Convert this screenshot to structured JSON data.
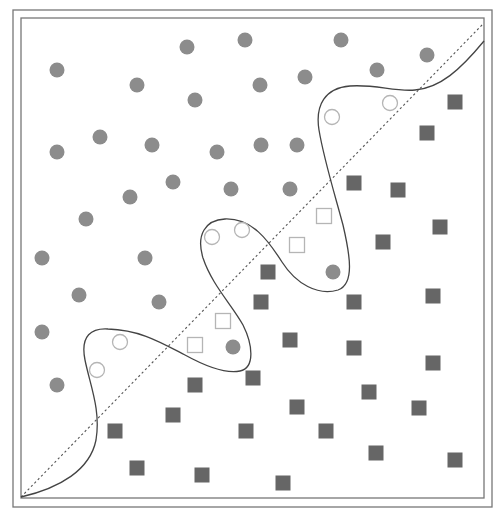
{
  "colors": {
    "background": "#ffffff",
    "frame": "#777777",
    "boundary_curve": "#444444",
    "linear_boundary": "#555555",
    "class_a_fill": "#8c8c8c",
    "class_b_fill": "#666666",
    "hollow_stroke": "#b5b5b5"
  },
  "frame": {
    "outer": {
      "x": 13,
      "y": 10,
      "w": 479,
      "h": 497
    },
    "inner": {
      "x": 21,
      "y": 18,
      "w": 463,
      "h": 480
    }
  },
  "linear_boundary": {
    "style": "dotted",
    "from": [
      21,
      497
    ],
    "to": [
      483,
      24
    ]
  },
  "nonlinear_boundary": {
    "style": "solid",
    "path": "M21,497 C60,488 90,470 96,440 C101,410 90,385 85,360 C80,335 92,328 108,329 C140,330 160,342 185,355 C205,366 225,374 240,371 C255,368 253,345 243,325 C232,305 212,285 203,258 C196,235 205,220 225,219 C252,218 268,240 282,262 C296,284 318,296 338,290 C355,284 350,255 343,225 C335,195 324,160 319,130 C315,105 325,88 350,86 C375,84 395,92 415,90 C440,88 460,70 484,41"
  },
  "class_a_circles": [
    [
      57,
      70
    ],
    [
      137,
      85
    ],
    [
      187,
      47
    ],
    [
      245,
      40
    ],
    [
      195,
      100
    ],
    [
      260,
      85
    ],
    [
      305,
      77
    ],
    [
      341,
      40
    ],
    [
      377,
      70
    ],
    [
      427,
      55
    ],
    [
      57,
      152
    ],
    [
      100,
      137
    ],
    [
      152,
      145
    ],
    [
      217,
      152
    ],
    [
      261,
      145
    ],
    [
      297,
      145
    ],
    [
      173,
      182
    ],
    [
      130,
      197
    ],
    [
      231,
      189
    ],
    [
      290,
      189
    ],
    [
      86,
      219
    ],
    [
      42,
      258
    ],
    [
      145,
      258
    ],
    [
      79,
      295
    ],
    [
      159,
      302
    ],
    [
      42,
      332
    ],
    [
      57,
      385
    ],
    [
      233,
      347
    ],
    [
      333,
      272
    ]
  ],
  "class_a_hollow_circles": [
    [
      332,
      117
    ],
    [
      390,
      103
    ],
    [
      212,
      237
    ],
    [
      242,
      230
    ],
    [
      120,
      342
    ],
    [
      97,
      370
    ]
  ],
  "class_b_squares": [
    [
      455,
      102
    ],
    [
      427,
      133
    ],
    [
      354,
      183
    ],
    [
      398,
      190
    ],
    [
      440,
      227
    ],
    [
      383,
      242
    ],
    [
      268,
      272
    ],
    [
      261,
      302
    ],
    [
      354,
      302
    ],
    [
      433,
      296
    ],
    [
      290,
      340
    ],
    [
      354,
      348
    ],
    [
      433,
      363
    ],
    [
      195,
      385
    ],
    [
      253,
      378
    ],
    [
      369,
      392
    ],
    [
      419,
      408
    ],
    [
      173,
      415
    ],
    [
      297,
      407
    ],
    [
      115,
      431
    ],
    [
      246,
      431
    ],
    [
      326,
      431
    ],
    [
      376,
      453
    ],
    [
      455,
      460
    ],
    [
      137,
      468
    ],
    [
      202,
      475
    ],
    [
      283,
      483
    ]
  ],
  "class_b_hollow_squares": [
    [
      324,
      216
    ],
    [
      297,
      245
    ],
    [
      223,
      321
    ],
    [
      195,
      345
    ]
  ],
  "marker": {
    "circle_r": 7.5,
    "square_size": 15
  }
}
